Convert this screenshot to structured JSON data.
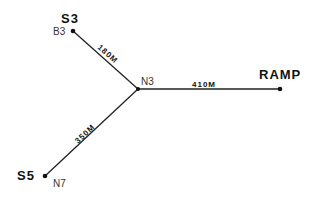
{
  "diagram": {
    "type": "network",
    "nodes": [
      {
        "id": "N3",
        "node_label": "N3",
        "station_label": "",
        "x": 138,
        "y": 89
      },
      {
        "id": "B3",
        "node_label": "B3",
        "station_label": "S3",
        "x": 73,
        "y": 31
      },
      {
        "id": "RAMP",
        "node_label": "",
        "station_label": "RAMP",
        "x": 280,
        "y": 89
      },
      {
        "id": "N7",
        "node_label": "N7",
        "station_label": "S5",
        "x": 45,
        "y": 176
      }
    ],
    "edges": [
      {
        "from": "N3",
        "to": "B3",
        "distance": "180M"
      },
      {
        "from": "N3",
        "to": "RAMP",
        "distance": "410M"
      },
      {
        "from": "N3",
        "to": "N7",
        "distance": "350M"
      }
    ]
  },
  "labels": {
    "s3": "S3",
    "b3": "B3",
    "n3": "N3",
    "ramp": "RAMP",
    "s5": "S5",
    "n7": "N7",
    "d180": "180M",
    "d410": "410M",
    "d350": "350M"
  },
  "colors": {
    "line": "#222222",
    "text": "#111111",
    "background": "#ffffff"
  }
}
